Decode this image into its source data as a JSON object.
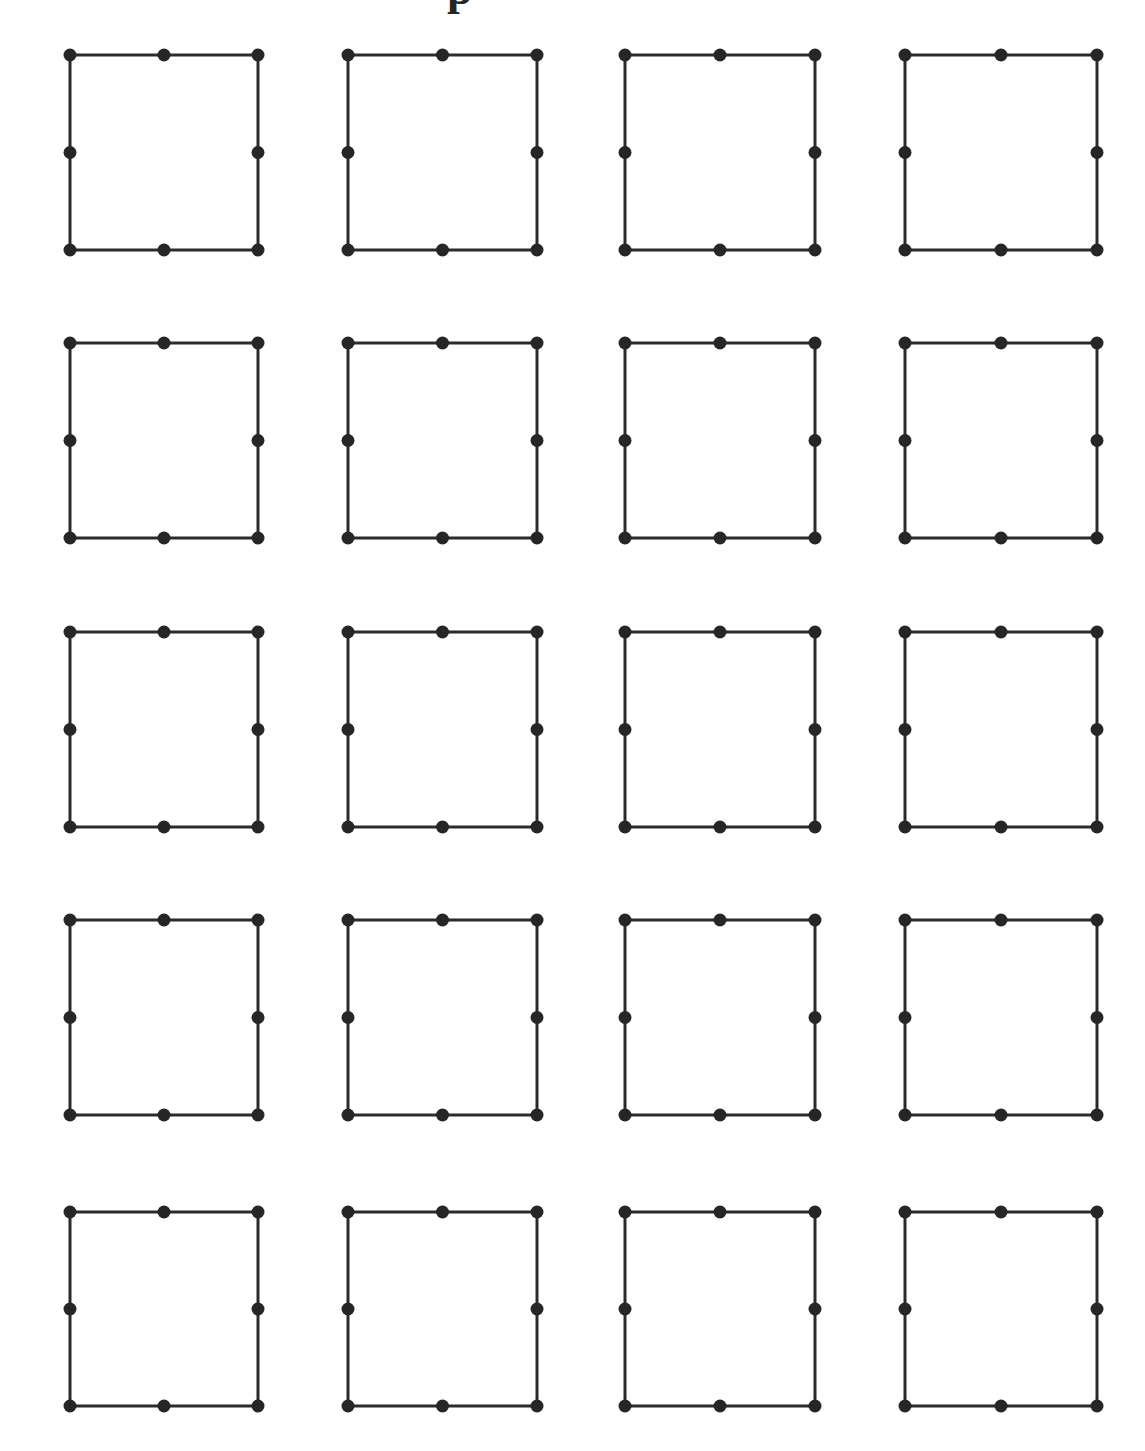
{
  "figure": {
    "kind": "dot-lattice-grid",
    "title": "",
    "background_color": "#ffffff",
    "canvas": {
      "width": 1145,
      "height": 1451
    },
    "stroke_color": "#2b2b2b",
    "dot_color": "#262626",
    "stroke_width": 3,
    "dot_radius": 6.5,
    "grid": {
      "columns": 4,
      "rows": 5,
      "cell_count": 20,
      "column_left_x": [
        70,
        348,
        625,
        905
      ],
      "column_right_x": [
        258,
        537,
        815,
        1097
      ],
      "row_top_y": [
        55,
        343,
        632,
        920,
        1212
      ],
      "row_bottom_y": [
        250,
        538,
        827,
        1115,
        1406
      ],
      "column_gap": 88,
      "row_gap": 93
    },
    "cell": {
      "label": "square-with-eight-dots",
      "shape": "square-outline",
      "approx_width": 189,
      "approx_height": 195,
      "dot_count": 8,
      "dot_positions": [
        "top-left",
        "top-center",
        "top-right",
        "middle-left",
        "middle-right",
        "bottom-left",
        "bottom-center",
        "bottom-right"
      ]
    },
    "cells": [
      {
        "row": 1,
        "col": 1,
        "id": "cell-r1c1"
      },
      {
        "row": 1,
        "col": 2,
        "id": "cell-r1c2"
      },
      {
        "row": 1,
        "col": 3,
        "id": "cell-r1c3"
      },
      {
        "row": 1,
        "col": 4,
        "id": "cell-r1c4"
      },
      {
        "row": 2,
        "col": 1,
        "id": "cell-r2c1"
      },
      {
        "row": 2,
        "col": 2,
        "id": "cell-r2c2"
      },
      {
        "row": 2,
        "col": 3,
        "id": "cell-r2c3"
      },
      {
        "row": 2,
        "col": 4,
        "id": "cell-r2c4"
      },
      {
        "row": 3,
        "col": 1,
        "id": "cell-r3c1"
      },
      {
        "row": 3,
        "col": 2,
        "id": "cell-r3c2"
      },
      {
        "row": 3,
        "col": 3,
        "id": "cell-r3c3"
      },
      {
        "row": 3,
        "col": 4,
        "id": "cell-r3c4"
      },
      {
        "row": 4,
        "col": 1,
        "id": "cell-r4c1"
      },
      {
        "row": 4,
        "col": 2,
        "id": "cell-r4c2"
      },
      {
        "row": 4,
        "col": 3,
        "id": "cell-r4c3"
      },
      {
        "row": 4,
        "col": 4,
        "id": "cell-r4c4"
      },
      {
        "row": 5,
        "col": 1,
        "id": "cell-r5c1"
      },
      {
        "row": 5,
        "col": 2,
        "id": "cell-r5c2"
      },
      {
        "row": 5,
        "col": 3,
        "id": "cell-r5c3"
      },
      {
        "row": 5,
        "col": 4,
        "id": "cell-r5c4"
      }
    ],
    "clipped_glyph": {
      "text": "p",
      "note": "partial character clipped by the top edge of the page",
      "x": 447,
      "y": 0,
      "width": 28,
      "height": 14,
      "font_size": 46,
      "offset_y": -34
    }
  }
}
